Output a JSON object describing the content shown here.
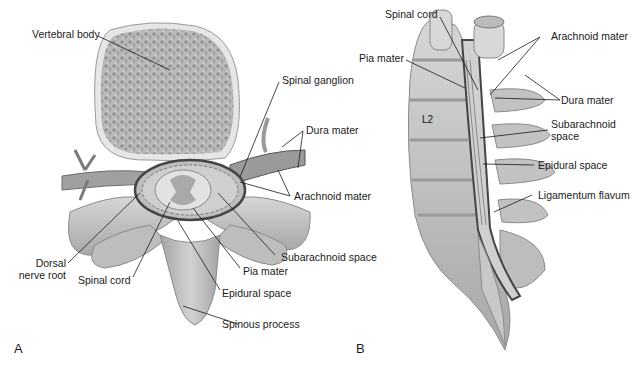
{
  "figure": {
    "panels": [
      {
        "id": "A",
        "view": "transverse section of vertebra and spinal cord",
        "labels": {
          "vertebral_body": "Vertebral body",
          "spinal_ganglion": "Spinal ganglion",
          "dura_mater": "Dura mater",
          "arachnoid_mater": "Arachnoid mater",
          "subarachnoid_space": "Subarachnoid space",
          "pia_mater": "Pia mater",
          "epidural_space": "Epidural space",
          "spinous_process": "Spinous process",
          "spinal_cord": "Spinal cord",
          "dorsal_nerve_root_1": "Dorsal",
          "dorsal_nerve_root_2": "nerve root"
        },
        "letter": "A"
      },
      {
        "id": "B",
        "view": "sagittal section of lumbar spine and cauda",
        "labels": {
          "spinal_cord": "Spinal cord",
          "pia_mater": "Pia mater",
          "arachnoid_mater": "Arachnoid mater",
          "dura_mater": "Dura mater",
          "subarachnoid_space_1": "Subarachnoid",
          "subarachnoid_space_2": "space",
          "epidural_space": "Epidural space",
          "ligamentum_flavum": "Ligamentum flavum",
          "vertebra_level": "L2"
        },
        "letter": "B"
      }
    ],
    "colors": {
      "bone": "#c9c9c9",
      "bone_dark": "#9a9a9a",
      "membrane": "#5a5a5a",
      "leader_line": "#1a1a1a"
    }
  }
}
